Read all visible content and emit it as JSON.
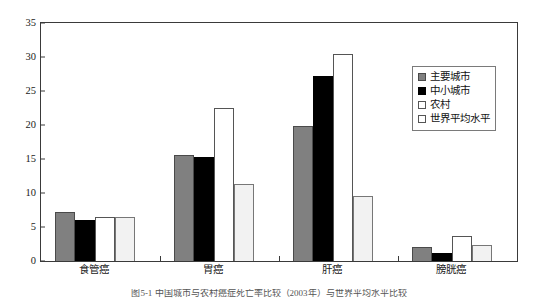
{
  "chart_data": {
    "type": "bar",
    "title": "",
    "xlabel": "",
    "ylabel": "",
    "ylim": [
      0,
      35
    ],
    "yticks": [
      0,
      5,
      10,
      15,
      20,
      25,
      30,
      35
    ],
    "ytick_labels": [
      "0",
      "5",
      "10",
      "15",
      "20",
      "25",
      "30",
      "35"
    ],
    "grid": false,
    "legend_position": "upper right",
    "categories": [
      "食管癌",
      "胃癌",
      "肝癌",
      "膀胱癌"
    ],
    "series": [
      {
        "name": "主要城市",
        "color": "#808080",
        "values": [
          7.2,
          15.6,
          19.8,
          2.1
        ]
      },
      {
        "name": "中小城市",
        "color": "#000000",
        "values": [
          6.1,
          15.3,
          27.2,
          1.2
        ]
      },
      {
        "name": "农村",
        "color": "#ffffff",
        "values": [
          6.4,
          22.5,
          30.4,
          3.7
        ]
      },
      {
        "name": "世界平均水平",
        "color": "#f2f2f2",
        "values": [
          6.4,
          11.3,
          9.6,
          2.4
        ]
      }
    ]
  },
  "caption": "图5-1 中国城市与农村癌症死亡率比较（2003年）与世界平均水平比较"
}
